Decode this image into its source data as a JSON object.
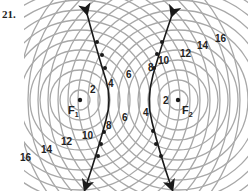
{
  "problem_number": "21.",
  "foci": [
    {
      "label": "F",
      "sub": "1",
      "x": 80,
      "y": 100
    },
    {
      "label": "F",
      "sub": "2",
      "x": 178,
      "y": 100
    }
  ],
  "circle_style": {
    "color": "#a8a8a8",
    "radius_step_px": 10,
    "count": 16
  },
  "curve_color": "#1a1a1a",
  "labels": [
    {
      "text": "2",
      "x": 90,
      "y": 85
    },
    {
      "text": "4",
      "x": 108,
      "y": 79
    },
    {
      "text": "6",
      "x": 126,
      "y": 70
    },
    {
      "text": "6",
      "x": 122,
      "y": 113
    },
    {
      "text": "4",
      "x": 143,
      "y": 108
    },
    {
      "text": "2",
      "x": 163,
      "y": 96
    },
    {
      "text": "8",
      "x": 148,
      "y": 63
    },
    {
      "text": "10",
      "x": 158,
      "y": 56
    },
    {
      "text": "12",
      "x": 180,
      "y": 49
    },
    {
      "text": "14",
      "x": 197,
      "y": 41
    },
    {
      "text": "16",
      "x": 215,
      "y": 34
    },
    {
      "text": "8",
      "x": 106,
      "y": 121
    },
    {
      "text": "10",
      "x": 82,
      "y": 131
    },
    {
      "text": "12",
      "x": 61,
      "y": 137
    },
    {
      "text": "14",
      "x": 41,
      "y": 145
    },
    {
      "text": "16",
      "x": 20,
      "y": 153
    }
  ]
}
